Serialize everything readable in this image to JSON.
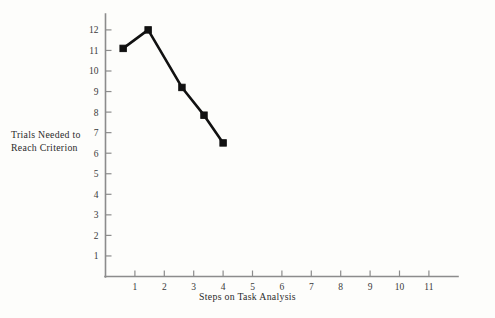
{
  "chart_data": {
    "type": "line",
    "title": "",
    "xlabel": "Steps on Task Analysis",
    "ylabel": "Trials Needed to Reach Criterion",
    "ylabel_line1": "Trials Needed to",
    "ylabel_line2": "Reach Criterion",
    "xlim": [
      0,
      11.6
    ],
    "ylim": [
      0,
      12.6
    ],
    "xticks": [
      1,
      2,
      3,
      4,
      5,
      6,
      7,
      8,
      9,
      10,
      11
    ],
    "yticks": [
      1,
      2,
      3,
      4,
      5,
      6,
      7,
      8,
      9,
      10,
      11,
      12
    ],
    "xtick_labels": [
      "1",
      "2",
      "3",
      "4",
      "5",
      "6",
      "7",
      "8",
      "9",
      "10",
      "11"
    ],
    "ytick_labels": [
      "1",
      "2",
      "3",
      "4",
      "5",
      "6",
      "7",
      "8",
      "9",
      "10",
      "11",
      "12"
    ],
    "grid": false,
    "legend": false,
    "series": [
      {
        "name": "Trials to criterion",
        "marker": "filled-square",
        "color": "#111111",
        "x": [
          0.6,
          1.45,
          2.6,
          3.35,
          4.0
        ],
        "values": [
          11.1,
          12.0,
          9.2,
          7.85,
          6.5
        ]
      }
    ]
  },
  "figure": {
    "background_color": "#fdfdfb",
    "axis_color": "#8c8c8c",
    "line_color": "#111111"
  }
}
